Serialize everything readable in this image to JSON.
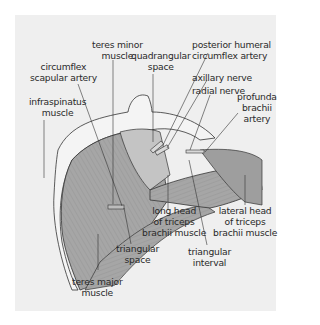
{
  "figure": {
    "background_color": "#efefef",
    "muscle_color": "#a8a8a8",
    "bone_color": "#f4f4f4",
    "labels": {
      "teres_minor": [
        "teres minor",
        "muscle"
      ],
      "circumflex_scapular": [
        "circumflex",
        "scapular artery"
      ],
      "quadrangular_space": [
        "quadrangular",
        "space"
      ],
      "posterior_humeral": [
        "posterior humeral",
        "circumflex artery"
      ],
      "axillary_nerve": [
        "axillary nerve"
      ],
      "radial_nerve": [
        "radial nerve"
      ],
      "profunda_brachii": [
        "profunda",
        "brachii",
        "artery"
      ],
      "infraspinatus": [
        "infraspinatus",
        "muscle"
      ],
      "long_head_triceps": [
        "long head",
        "of triceps",
        "brachii muscle"
      ],
      "lateral_head_triceps": [
        "lateral head",
        "of triceps",
        "brachii muscle"
      ],
      "triangular_space": [
        "triangular",
        "space"
      ],
      "triangular_interval": [
        "triangular",
        "interval"
      ],
      "teres_major": [
        "teres major",
        "muscle"
      ]
    }
  }
}
